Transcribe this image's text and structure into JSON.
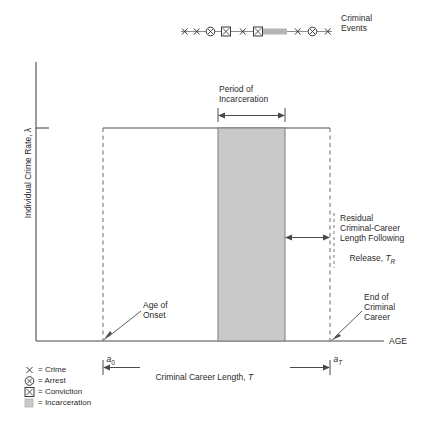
{
  "figure": {
    "type": "criminal-career-diagram",
    "axes": {
      "y_label": "Individual Crime Rate, λ",
      "x_label": "AGE",
      "x_tick_labels": [
        "a0",
        "aT"
      ],
      "x_tick_label_left_base": "a",
      "x_tick_label_left_sub": "0",
      "x_tick_label_right_base": "a",
      "x_tick_label_right_sub": "T"
    },
    "events_track": {
      "caption_line1": "Criminal",
      "caption_line2": "Events",
      "markers": [
        {
          "type": "crime",
          "x": 185
        },
        {
          "type": "crime",
          "x": 197
        },
        {
          "type": "arrest",
          "x": 210
        },
        {
          "type": "conviction",
          "x": 226
        },
        {
          "type": "crime",
          "x": 243
        },
        {
          "type": "conviction",
          "x": 257
        },
        {
          "type": "incarceration",
          "x": 263,
          "x2": 287
        },
        {
          "type": "crime",
          "x": 298
        },
        {
          "type": "arrest",
          "x": 313
        },
        {
          "type": "crime",
          "x": 328
        }
      ]
    },
    "annotations": {
      "incarceration_period_line1": "Period of",
      "incarceration_period_line2": "Incarceration",
      "residual_line1": "Residual",
      "residual_line2": "Criminal-Career",
      "residual_line3": "Length Following",
      "residual_line4_base": "Release, ",
      "residual_line4_var": "T",
      "residual_line4_sub": "R",
      "age_of_onset_line1": "Age of",
      "age_of_onset_line2": "Onset",
      "end_of_career_line1": "End of",
      "end_of_career_line2": "Criminal",
      "end_of_career_line3": "Career",
      "career_length_base": "Criminal Career Length, ",
      "career_length_var": "T"
    },
    "legend": [
      {
        "symbol": "crime",
        "glyph": "x",
        "label": "= Crime"
      },
      {
        "symbol": "arrest",
        "glyph": "⊗",
        "label": "= Arrest"
      },
      {
        "symbol": "conviction",
        "glyph": "⊠",
        "label": "= Conviction"
      },
      {
        "symbol": "incarceration",
        "glyph": "■",
        "label": "= Incarceration"
      }
    ],
    "colors": {
      "line": "#4a4a4a",
      "text": "#2b2b2b",
      "incarceration_fill": "#c9c9c9",
      "incarceration_stroke": "#8a8a8a",
      "background": "#ffffff"
    },
    "geometry": {
      "plot_left": 103,
      "plot_right": 330,
      "plot_top": 128,
      "baseline_y": 341,
      "axis_x": 36,
      "incarceration_left": 218,
      "incarceration_right": 285
    }
  }
}
